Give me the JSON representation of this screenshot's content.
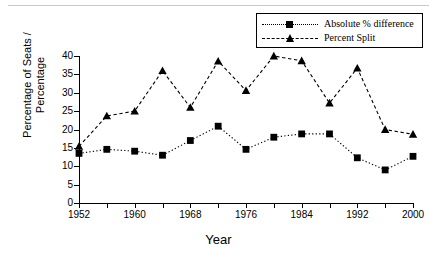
{
  "chart_data": {
    "type": "line",
    "title": "",
    "xlabel": "Year",
    "ylabel": "Percentage of Seats / Percentage",
    "ylabel_line1": "Percentage of Seats /",
    "ylabel_line2": "Percentage",
    "x": [
      1952,
      1956,
      1960,
      1964,
      1968,
      1972,
      1976,
      1980,
      1984,
      1988,
      1992,
      1996,
      2000
    ],
    "xlim": [
      1952,
      2000
    ],
    "ylim": [
      0,
      40
    ],
    "yticks": [
      0,
      5,
      10,
      15,
      20,
      25,
      30,
      35,
      40
    ],
    "xticks": [
      1952,
      1956,
      1960,
      1964,
      1968,
      1972,
      1976,
      1980,
      1984,
      1988,
      1992,
      1996,
      2000
    ],
    "xtick_labels": [
      "1952",
      "",
      "1960",
      "",
      "1968",
      "",
      "1976",
      "",
      "1984",
      "",
      "1992",
      "",
      "2000"
    ],
    "grid": false,
    "legend_position": "top-right",
    "series": [
      {
        "name": "Absolute % difference",
        "marker": "square",
        "linestyle": "dotted",
        "color": "#000000",
        "values": [
          13.5,
          14.6,
          14.1,
          13.0,
          17.0,
          20.9,
          14.6,
          17.9,
          18.8,
          18.8,
          12.3,
          9.0,
          12.7
        ]
      },
      {
        "name": "Percent Split",
        "marker": "triangle",
        "linestyle": "dashed",
        "color": "#000000",
        "values": [
          15.4,
          23.7,
          25.0,
          36.0,
          26.0,
          38.6,
          30.6,
          40.0,
          38.7,
          27.2,
          36.7,
          20.0,
          18.7
        ]
      }
    ]
  }
}
